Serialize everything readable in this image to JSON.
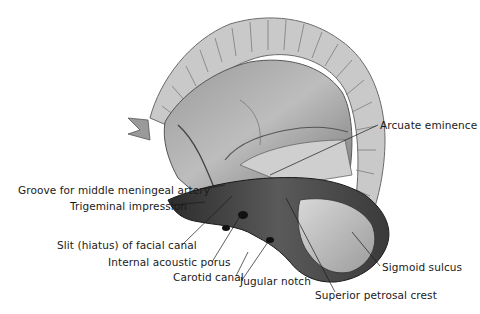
{
  "figure": {
    "labels": [
      {
        "id": "arcuate-eminence",
        "text": "Arcuate eminence",
        "x": 380,
        "y": 119
      },
      {
        "id": "groove-middle-meningeal-artery",
        "text": "Groove for middle meningeal artery",
        "x": 18,
        "y": 184
      },
      {
        "id": "trigeminal-impression",
        "text": "Trigeminal impression",
        "x": 70,
        "y": 200
      },
      {
        "id": "slit-hiatus-facial-canal",
        "text": "Slit (hiatus) of facial canal",
        "x": 57,
        "y": 239
      },
      {
        "id": "internal-acoustic-porus",
        "text": "Internal acoustic porus",
        "x": 108,
        "y": 256
      },
      {
        "id": "carotid-canal",
        "text": "Carotid canal",
        "x": 173,
        "y": 270
      },
      {
        "id": "jugular-notch",
        "text": "Jugular notch",
        "x": 240,
        "y": 275
      },
      {
        "id": "sigmoid-sulcus",
        "text": "Sigmoid sulcus",
        "x": 382,
        "y": 261
      },
      {
        "id": "superior-petrosal-crest",
        "text": "Superior petrosal crest",
        "x": 315,
        "y": 289
      }
    ]
  }
}
